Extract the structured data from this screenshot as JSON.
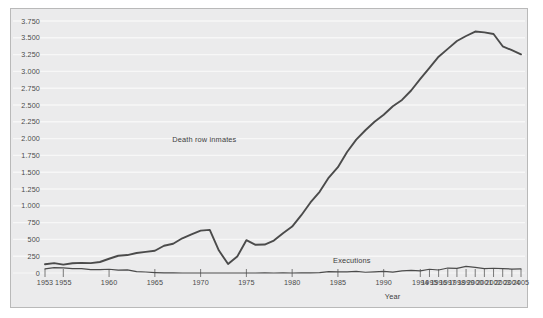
{
  "chart_data": {
    "type": "line",
    "title": "",
    "xlabel": "Year",
    "ylabel": "",
    "xlim": [
      1953,
      2005
    ],
    "ylim": [
      0,
      3750
    ],
    "grid": true,
    "legend_position": "inline-annotation",
    "y_ticks": [
      "0",
      "250",
      "500",
      "750",
      "1.000",
      "1.250",
      "1.500",
      "1.750",
      "2.000",
      "2.250",
      "2.500",
      "2.750",
      "3.000",
      "3.250",
      "3.500",
      "3.750"
    ],
    "y_tick_values": [
      0,
      250,
      500,
      750,
      1000,
      1250,
      1500,
      1750,
      2000,
      2250,
      2500,
      2750,
      3000,
      3250,
      3500,
      3750
    ],
    "x_ticks": [
      "1953",
      "1955",
      "1960",
      "1965",
      "1970",
      "1975",
      "1980",
      "1985",
      "1990",
      "1994",
      "1995",
      "1996",
      "1997",
      "1998",
      "1999",
      "2000",
      "2001",
      "2002",
      "2003",
      "2004",
      "2005"
    ],
    "x_tick_values": [
      1953,
      1955,
      1960,
      1965,
      1970,
      1975,
      1980,
      1985,
      1990,
      1994,
      1995,
      1996,
      1997,
      1998,
      1999,
      2000,
      2001,
      2002,
      2003,
      2004,
      2005
    ],
    "x": [
      1953,
      1954,
      1955,
      1956,
      1957,
      1958,
      1959,
      1960,
      1961,
      1962,
      1963,
      1964,
      1965,
      1966,
      1967,
      1968,
      1969,
      1970,
      1971,
      1972,
      1973,
      1974,
      1975,
      1976,
      1977,
      1978,
      1979,
      1980,
      1981,
      1982,
      1983,
      1984,
      1985,
      1986,
      1987,
      1988,
      1989,
      1990,
      1991,
      1992,
      1993,
      1994,
      1995,
      1996,
      1997,
      1998,
      1999,
      2000,
      2001,
      2002,
      2003,
      2004,
      2005
    ],
    "series": [
      {
        "name": "Death row inmates",
        "color": "#4b4b4b",
        "annotation": "Death row inmates",
        "values": [
          131,
          147,
          125,
          146,
          151,
          147,
          164,
          212,
          257,
          267,
          297,
          315,
          331,
          406,
          435,
          517,
          575,
          631,
          642,
          334,
          134,
          244,
          488,
          420,
          423,
          482,
          593,
          691,
          860,
          1050,
          1209,
          1420,
          1575,
          1800,
          1984,
          2124,
          2250,
          2356,
          2482,
          2575,
          2716,
          2890,
          3054,
          3219,
          3335,
          3452,
          3527,
          3593,
          3581,
          3557,
          3374,
          3315,
          3254
        ]
      },
      {
        "name": "Executions",
        "color": "#4b4b4b",
        "annotation": "Executions",
        "values": [
          62,
          81,
          76,
          65,
          65,
          49,
          49,
          56,
          42,
          47,
          21,
          15,
          7,
          1,
          2,
          0,
          0,
          0,
          0,
          0,
          0,
          0,
          0,
          0,
          1,
          0,
          2,
          0,
          1,
          2,
          5,
          21,
          18,
          18,
          25,
          11,
          16,
          23,
          14,
          31,
          38,
          31,
          56,
          45,
          74,
          68,
          98,
          85,
          66,
          71,
          65,
          59,
          60
        ]
      }
    ]
  },
  "annotations": {
    "death_row": "Death row inmates",
    "executions": "Executions"
  },
  "axis": {
    "x_title": "Year"
  },
  "style": {
    "plot_background": "#ebebec",
    "frame_border": "#b9b9b9",
    "gridline_color": "#f7f7f7",
    "line_color": "#4b4b4b",
    "tick_text_color": "#4a4a4a",
    "page_background": "#ffffff"
  }
}
